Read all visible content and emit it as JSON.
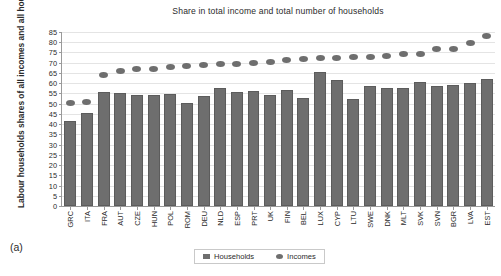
{
  "figure": {
    "panel_label": "(a)"
  },
  "chart_data": {
    "type": "bar",
    "title": "Share in total income and total number of households",
    "xlabel": "",
    "ylabel": "Labour households shares of all incomes and all households",
    "ylim": [
      0,
      85
    ],
    "ytick_step": 5,
    "yticks": [
      85,
      80,
      75,
      70,
      65,
      60,
      55,
      50,
      45,
      40,
      35,
      30,
      25,
      20,
      15,
      10,
      5,
      0
    ],
    "grid": true,
    "legend_position": "bottom",
    "categories": [
      "GRC",
      "ITA",
      "FRA",
      "AUT",
      "CZE",
      "HUN",
      "POL",
      "ROM",
      "DEU",
      "NLD",
      "ESP",
      "PRT",
      "UK",
      "FIN",
      "BEL",
      "LUX",
      "CYP",
      "LTU",
      "SWE",
      "DNK",
      "MLT",
      "SVK",
      "SVN",
      "BGR",
      "LVA",
      "EST"
    ],
    "series": [
      {
        "name": "Households",
        "type": "bar",
        "color": "#6e6e6e",
        "values": [
          41.6,
          45.5,
          55.8,
          55.3,
          54.0,
          54.0,
          54.5,
          50.2,
          53.9,
          57.6,
          55.9,
          56.4,
          54.0,
          56.5,
          53.0,
          65.4,
          61.5,
          52.3,
          58.6,
          57.8,
          57.7,
          60.6,
          58.7,
          59.2,
          59.9,
          62.2
        ]
      },
      {
        "name": "Incomes",
        "type": "scatter",
        "color": "#6e6e6e",
        "values": [
          50.2,
          50.9,
          64.0,
          65.8,
          66.7,
          67.0,
          68.0,
          68.4,
          68.8,
          69.6,
          69.5,
          69.7,
          70.4,
          71.2,
          71.9,
          72.3,
          72.4,
          72.7,
          72.8,
          73.4,
          74.2,
          74.4,
          76.5,
          76.7,
          79.5,
          83.0
        ]
      }
    ]
  },
  "legend": {
    "items": [
      {
        "label": "Households",
        "marker": "square-marker-icon"
      },
      {
        "label": "Incomes",
        "marker": "circle-marker-icon"
      }
    ]
  }
}
